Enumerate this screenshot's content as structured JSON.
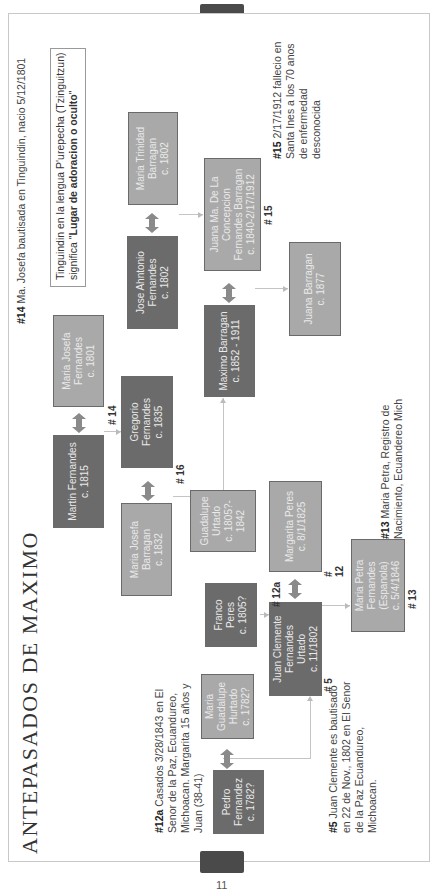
{
  "page": {
    "title": "ANTEPASADOS DE MAXIMO",
    "page_number": "11"
  },
  "callout": {
    "line1": "Tinguindin en la lengua P'urepecha (Tzinguitzun)",
    "line2_prefix": "significa \"",
    "line2_bold": "Lugar de adoracion o oculto",
    "line2_suffix": "\""
  },
  "notes": {
    "n14": {
      "tag": "#14",
      "text": " Ma. Josefa bautisada en Tinguindin, nacio 5/12/1801"
    },
    "n15": {
      "tag": "#15",
      "text": " 2/17/1912 fallecio en Santa Ines a los 70 anos de enfermedad desconocida"
    },
    "n13": {
      "tag": "#13",
      "text": " Maria Petra, Registro de Nacimiento, Ecuandereo Mich"
    },
    "n12a": {
      "tag": "#12a",
      "text": " Casados 3/28/1843 en El Senor de la Paz, Ecuandureo, Michoacan. Margarita 15 años y Juan (38-41)"
    },
    "n5": {
      "tag": "#5",
      "text": " Juan Clemente es bautisado en 22 de Nov., 1802 en El Senor de la Paz Ecuandureo, Michoacan."
    }
  },
  "tags": {
    "t14": "# 14",
    "t16": "# 16",
    "t15": "# 15",
    "t12": "#\n12",
    "t12a": "# 12a",
    "t5": "# 5",
    "t13": "# 13"
  },
  "persons": [
    {
      "id": "pedro",
      "lines": [
        "Pedro",
        "Fernandez",
        "c. 1782?"
      ],
      "shade": "dark"
    },
    {
      "id": "maria-guadalupe-hurtado",
      "lines": [
        "Maria",
        "Guadalupe",
        "Hurtado",
        "c. 1782?"
      ],
      "shade": "light"
    },
    {
      "id": "juan-clemente",
      "lines": [
        "Juan Clemente",
        "Fernandes",
        "Urtado",
        "c. 11/1802"
      ],
      "shade": "dark"
    },
    {
      "id": "franco-peres",
      "lines": [
        "Franco",
        "Peres",
        "c. 1805?"
      ],
      "shade": "dark"
    },
    {
      "id": "guadalupe-urtado",
      "lines": [
        "Guadalupe",
        "Urtado",
        "c. 1805?-",
        "1842"
      ],
      "shade": "light"
    },
    {
      "id": "margarita-peres",
      "lines": [
        "Margarita Peres",
        "c. 8/1/1825"
      ],
      "shade": "light"
    },
    {
      "id": "maria-petra",
      "lines": [
        "Maria Petra",
        "Fernandes",
        "(Espanola)",
        "c. 5/4/1846"
      ],
      "shade": "light"
    },
    {
      "id": "martin-fernandes",
      "lines": [
        "Martin Fernandes",
        "c. 1815"
      ],
      "shade": "dark"
    },
    {
      "id": "maria-josefa-fernandes",
      "lines": [
        "Maria Josefa",
        "Fernandes",
        "c. 1801"
      ],
      "shade": "light"
    },
    {
      "id": "gregorio",
      "lines": [
        "Gregorio",
        "Fernandes",
        "c. 1835"
      ],
      "shade": "dark"
    },
    {
      "id": "maria-josefa-barragan",
      "lines": [
        "Maria Josefa",
        "Barragan",
        "c. 1832"
      ],
      "shade": "light"
    },
    {
      "id": "maximo",
      "lines": [
        "Maximo Barragan",
        "c. 1852 - 1911"
      ],
      "shade": "dark"
    },
    {
      "id": "jose-ahntonio",
      "lines": [
        "Jose Ahntonio",
        "Fernandes",
        "c. 1802"
      ],
      "shade": "dark"
    },
    {
      "id": "maria-trinidad",
      "lines": [
        "Maria Trinidad",
        "Barragan",
        "c. 1802"
      ],
      "shade": "light"
    },
    {
      "id": "juana-concepcion",
      "lines": [
        "Juana Ma. De La",
        "Concepcion",
        "Fernandes Barragan",
        "c. 1840-2/17/1912"
      ],
      "shade": "light"
    },
    {
      "id": "juana-barragan",
      "lines": [
        "Juana Barragan",
        "c. 1877"
      ],
      "shade": "light"
    }
  ],
  "colors": {
    "dark_box": "#6b6b6b",
    "light_box": "#a9a9a9",
    "arrow": "#8a8a8a",
    "connector": "#c4c4c4"
  }
}
